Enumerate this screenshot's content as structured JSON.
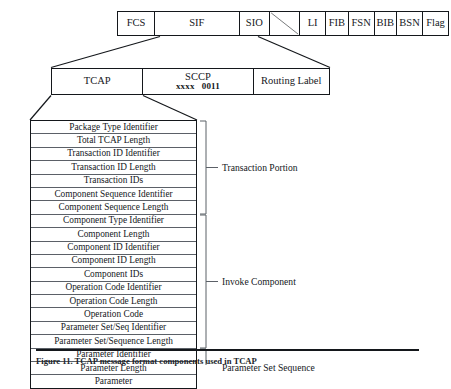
{
  "figure": {
    "frame_row": {
      "name": "MSU frame fields",
      "cells": [
        {
          "label": "FCS",
          "width": 43
        },
        {
          "label": "SIF",
          "width": 98
        },
        {
          "label": "SIO",
          "width": 35
        },
        {
          "label": "",
          "width": 35,
          "icon": "diagonal-slash"
        },
        {
          "label": "LI",
          "width": 30
        },
        {
          "label": "FIB",
          "width": 26
        },
        {
          "label": "FSN",
          "width": 30
        },
        {
          "label": "BIB",
          "width": 26
        },
        {
          "label": "BSN",
          "width": 30
        },
        {
          "label": "Flag",
          "width": 29
        }
      ]
    },
    "sif_row": {
      "name": "SIF breakdown",
      "cells": [
        {
          "label": "TCAP",
          "sub": "",
          "width": 92
        },
        {
          "label": "SCCP",
          "sub_left": "xxxx",
          "sub_right": "0011",
          "width": 111
        },
        {
          "label": "Routing Label",
          "sub": "",
          "width": 76
        }
      ]
    },
    "tcap_fields": [
      "Package Type Identifier",
      "Total TCAP Length",
      "Transaction ID Identifier",
      "Transaction ID Length",
      "Transaction IDs",
      "Component Sequence Identifier",
      "Component Sequence Length",
      "Component Type Identifier",
      "Component Length",
      "Component ID Identifier",
      "Component ID Length",
      "Component IDs",
      "Operation Code Identifier",
      "Operation Code Length",
      "Operation Code",
      "Parameter Set/Seq Identifier",
      "Parameter Set/Sequence Length",
      "Parameter Identifier",
      "Parameter Length",
      "Parameter"
    ],
    "brackets": [
      {
        "label": "Transaction Portion",
        "start_index": 0,
        "end_index": 6
      },
      {
        "label": "Invoke Component",
        "start_index": 7,
        "end_index": 16
      },
      {
        "label": "Parameter Set Sequence",
        "start_index": 17,
        "end_index": 19
      }
    ],
    "caption": "Figure 11.  TCAP message format components used in TCAP"
  },
  "colors": {
    "line": "#14171b",
    "inner_line": "#5b6067",
    "text": "#15181c",
    "background": "#ffffff"
  }
}
